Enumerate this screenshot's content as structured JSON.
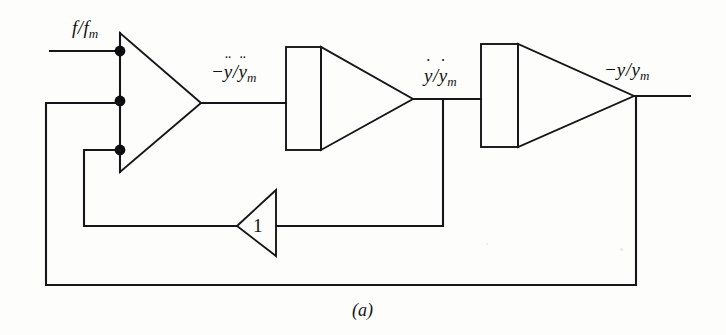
{
  "figure": {
    "caption": "(a)",
    "kind": "analog-computer-block-diagram",
    "background_color": "#fdfdfb",
    "ink_color": "#16161a"
  },
  "labels": {
    "input_signal": {
      "text": "f/fm",
      "numerator": "f",
      "slash": "/",
      "denominator": "f",
      "subscript": "m",
      "accent": ""
    },
    "acceleration": {
      "text": "-ÿ/ÿm",
      "sign": "−",
      "numerator": "y",
      "slash": "/",
      "denominator": "y",
      "subscript": "m",
      "accent": "¨"
    },
    "velocity": {
      "text": "ẏ/ẏm",
      "sign": "",
      "numerator": "y",
      "slash": "/",
      "denominator": "y",
      "subscript": "m",
      "accent": "˙"
    },
    "displacement": {
      "text": "-y/ym",
      "sign": "−",
      "numerator": "y",
      "slash": "/",
      "denominator": "y",
      "subscript": "m",
      "accent": ""
    },
    "inverter_gain": "1"
  },
  "blocks": [
    {
      "name": "summing-amplifier",
      "type": "triangle-right",
      "inputs": 3,
      "label": ""
    },
    {
      "name": "first-integrator",
      "type": "integrator",
      "label": ""
    },
    {
      "name": "second-integrator",
      "type": "integrator",
      "label": ""
    },
    {
      "name": "inverter",
      "type": "triangle-left",
      "label": "1"
    }
  ],
  "junction_dots": [
    {
      "name": "summing-input-1",
      "x": 120,
      "y": 51
    },
    {
      "name": "summing-input-2",
      "x": 120,
      "y": 101
    },
    {
      "name": "summing-input-3",
      "x": 120,
      "y": 150
    }
  ]
}
